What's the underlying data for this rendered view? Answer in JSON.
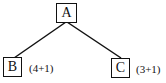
{
  "diagram": {
    "type": "tree",
    "nodes": [
      {
        "id": "A",
        "label": "A",
        "annotation": ""
      },
      {
        "id": "B",
        "label": "B",
        "annotation": "(4+1)"
      },
      {
        "id": "C",
        "label": "C",
        "annotation": "(3+1)"
      }
    ],
    "edges": [
      {
        "from": "A",
        "to": "B"
      },
      {
        "from": "A",
        "to": "C"
      }
    ],
    "colors": {
      "stroke": "#111111",
      "background": "#ffffff"
    }
  }
}
